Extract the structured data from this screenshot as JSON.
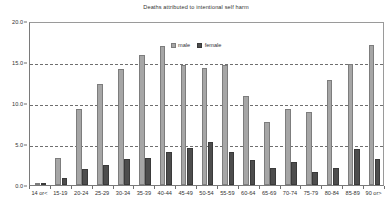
{
  "chart_data": {
    "type": "bar",
    "title": "Deaths attributed to intentional self harm",
    "xlabel": "",
    "ylabel": "",
    "ylim": [
      0.0,
      20.0
    ],
    "yticks": [
      0.0,
      5.0,
      10.0,
      15.0,
      20.0
    ],
    "ytick_labels": [
      "0.0",
      "5.0",
      "10.0",
      "15.0",
      "20.0"
    ],
    "grid": true,
    "grid_axis": "y",
    "legend_position": "top-center",
    "categories": [
      "14 or<",
      "15-19",
      "20-24",
      "25-29",
      "30-34",
      "35-39",
      "40-44",
      "45-49",
      "50-54",
      "55-59",
      "60-64",
      "65-69",
      "70-74",
      "75-79",
      "80-84",
      "85-89",
      "90 or>"
    ],
    "series": [
      {
        "name": "male",
        "color": "#a6a6a6",
        "values": [
          0.3,
          3.3,
          9.3,
          12.3,
          14.1,
          15.9,
          17.0,
          14.6,
          14.3,
          14.6,
          10.9,
          7.7,
          9.3,
          8.9,
          12.8,
          14.8,
          17.1
        ]
      },
      {
        "name": "female",
        "color": "#4d4d4d",
        "values": [
          0.2,
          0.9,
          2.0,
          2.5,
          3.2,
          3.3,
          4.0,
          4.5,
          5.3,
          4.0,
          3.0,
          2.1,
          2.8,
          1.6,
          2.1,
          4.4,
          3.2
        ]
      }
    ]
  },
  "legend": {
    "entries": [
      {
        "label": "male"
      },
      {
        "label": "female"
      }
    ]
  }
}
